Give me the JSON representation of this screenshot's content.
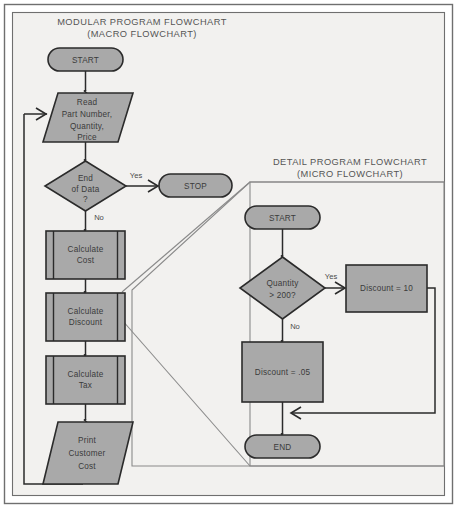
{
  "figure": {
    "background": "#f2f1ef",
    "border_color": "#6f6f6f",
    "shape_fill": "#a9a9a9",
    "shape_stroke": "#2b2b2b",
    "line_color": "#2b2b2b",
    "callout_color": "#8a8a8a",
    "text_color": "#3b3b3b",
    "title_color": "#555555"
  },
  "macro": {
    "title_line1": "MODULAR PROGRAM FLOWCHART",
    "title_line2": "(MACRO FLOWCHART)",
    "nodes": {
      "start": {
        "label": "START",
        "type": "terminal"
      },
      "read": {
        "line1": "Read",
        "line2": "Part Number,",
        "line3": "Quantity,",
        "line4": "Price",
        "type": "input-output"
      },
      "decision": {
        "line1": "End",
        "line2": "of Data",
        "line3": "?",
        "type": "decision"
      },
      "stop": {
        "label": "STOP",
        "type": "terminal"
      },
      "calc_cost": {
        "line1": "Calculate",
        "line2": "Cost",
        "type": "predefined-process"
      },
      "calc_discount": {
        "line1": "Calculate",
        "line2": "Discount",
        "type": "predefined-process"
      },
      "calc_tax": {
        "line1": "Calculate",
        "line2": "Tax",
        "type": "predefined-process"
      },
      "print": {
        "line1": "Print",
        "line2": "Customer",
        "line3": "Cost",
        "type": "input-output"
      }
    },
    "edges": {
      "yes": "Yes",
      "no": "No"
    }
  },
  "micro": {
    "title_line1": "DETAIL PROGRAM FLOWCHART",
    "title_line2": "(MICRO FLOWCHART)",
    "nodes": {
      "start": {
        "label": "START",
        "type": "terminal"
      },
      "decision": {
        "line1": "Quantity",
        "line2": "> 200?",
        "type": "decision"
      },
      "discount_yes": {
        "label": "Discount =  10",
        "type": "process"
      },
      "discount_no": {
        "label": "Discount =  .05",
        "type": "process"
      },
      "end": {
        "label": "END",
        "type": "terminal"
      }
    },
    "edges": {
      "yes": "Yes",
      "no": "No"
    }
  }
}
